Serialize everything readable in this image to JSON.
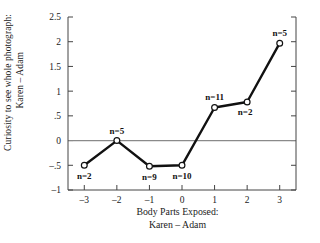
{
  "chart_data": {
    "type": "line",
    "title": "",
    "xlabel": "Body Parts Exposed:",
    "xlabel_line2": "Karen – Adam",
    "ylabel": "Curiosity to see whole photograph:",
    "ylabel_line2": "Karen – Adam",
    "x": [
      -3,
      -2,
      -1,
      0,
      1,
      2,
      3
    ],
    "values": [
      -0.5,
      0.0,
      -0.52,
      -0.5,
      0.67,
      0.78,
      1.97
    ],
    "point_labels": [
      "n=2",
      "n=5",
      "n=9",
      "n=10",
      "n=11",
      "n=2",
      "n=5"
    ],
    "point_label_positions": [
      "below",
      "above",
      "below",
      "below",
      "above",
      "below-right",
      "above"
    ],
    "xlim": [
      -3.5,
      3.5
    ],
    "ylim": [
      -1.0,
      2.5
    ],
    "xticks": [
      -3,
      -2,
      -1,
      0,
      1,
      2,
      3
    ],
    "xtick_labels": [
      "–3",
      "–2",
      "–1",
      "0",
      "1",
      "2",
      "3"
    ],
    "yticks": [
      -1,
      -0.5,
      0,
      0.5,
      1,
      1.5,
      2,
      2.5
    ],
    "ytick_labels": [
      "–1",
      "–.5",
      "0",
      ".5",
      "1",
      "1.5",
      "2",
      "2.5"
    ],
    "grid": false,
    "reference_line_y": 0,
    "legend": null,
    "marker_style": "open-circle",
    "line_color": "#111111",
    "reference_line_color": "#8a8a8a",
    "axis_color": "#444444"
  }
}
